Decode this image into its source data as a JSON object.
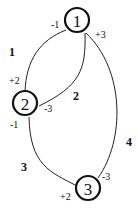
{
  "diagram": {
    "type": "graph",
    "nodes": [
      {
        "id": "1",
        "label": "1"
      },
      {
        "id": "2",
        "label": "2"
      },
      {
        "id": "3",
        "label": "3"
      }
    ],
    "edges": [
      {
        "id": "e1",
        "label": "1",
        "from": "1",
        "to": "2",
        "from_port": "-1",
        "to_port": "+2"
      },
      {
        "id": "e2",
        "label": "2",
        "from": "1",
        "to": "2",
        "from_port": "",
        "to_port": "-3"
      },
      {
        "id": "e3",
        "label": "3",
        "from": "2",
        "to": "3",
        "from_port": "-1",
        "to_port": "+2"
      },
      {
        "id": "e4",
        "label": "4",
        "from": "1",
        "to": "3",
        "from_port": "+3",
        "to_port": "-3"
      }
    ],
    "port_labels": {
      "n1_left": "-1",
      "n1_right": "+3",
      "n2_top": "+2",
      "n2_right": "-3",
      "n2_bottom": "-1",
      "n3_left": "+2",
      "n3_top": "-3"
    }
  }
}
